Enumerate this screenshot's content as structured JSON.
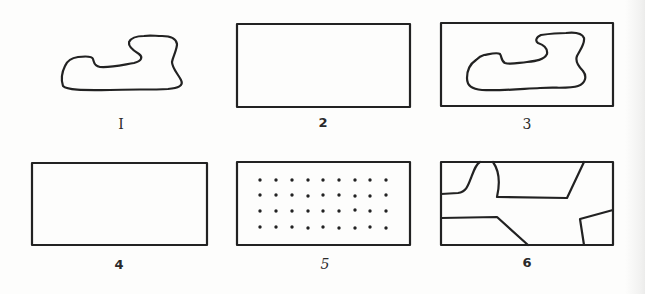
{
  "figure": {
    "stroke_color": "#222222",
    "background_color": "#fdfdfc",
    "panels": [
      {
        "id": 1,
        "label": "I",
        "description": "irregular closed contour (figure only)",
        "has_border": false
      },
      {
        "id": 2,
        "label": "2",
        "description": "empty rectangle (ground only)",
        "has_border": true
      },
      {
        "id": 3,
        "label": "3",
        "description": "irregular closed contour inside rectangle",
        "has_border": true
      },
      {
        "id": 4,
        "label": "4",
        "description": "empty rectangle",
        "has_border": true
      },
      {
        "id": 5,
        "label": "5",
        "description": "rectangle filled with a 4 x 9 grid of dots",
        "has_border": true,
        "dot_rows": 4,
        "dot_cols": 9
      },
      {
        "id": 6,
        "label": "6",
        "description": "rectangle divided by irregular lines into regions",
        "has_border": true
      }
    ]
  }
}
